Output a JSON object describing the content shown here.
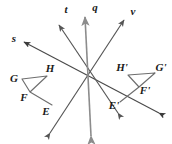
{
  "figure": {
    "background_color": "#ffffff",
    "width": 172,
    "height": 144,
    "center_of_rotation": {
      "x": 88,
      "y": 78
    },
    "colors": {
      "dark_line": "#3b3b3b",
      "gray_line": "#8c8c8c",
      "label_text": "#1a1a1a",
      "shape_stroke": "#6e6e6e"
    },
    "lines": [
      {
        "name": "t",
        "label": "t",
        "label_pos": {
          "x": 66,
          "y": 10
        },
        "color": "#555555",
        "from": {
          "x": 118,
          "y": 113
        },
        "to": {
          "x": 59,
          "y": 25
        },
        "arrow_start": true,
        "arrow_end": true
      },
      {
        "name": "q",
        "label": "q",
        "label_pos": {
          "x": 95,
          "y": 8
        },
        "color": "#8c8c8c",
        "from": {
          "x": 91,
          "y": 136
        },
        "to": {
          "x": 85,
          "y": 17
        },
        "arrow_start": true,
        "arrow_end": true
      },
      {
        "name": "v",
        "label": "v",
        "label_pos": {
          "x": 133,
          "y": 12
        },
        "color": "#555555",
        "from": {
          "x": 50,
          "y": 133
        },
        "to": {
          "x": 124,
          "y": 20
        },
        "arrow_start": true,
        "arrow_end": true
      },
      {
        "name": "s",
        "label": "s",
        "label_pos": {
          "x": 14,
          "y": 39
        },
        "color": "#4a4a4a",
        "from": {
          "x": 159,
          "y": 113
        },
        "to": {
          "x": 24,
          "y": 42
        },
        "arrow_start": true,
        "arrow_end": true
      }
    ],
    "shapes": [
      {
        "name": "preimage-EFGH",
        "stroke": "#6e6e6e",
        "vertices": [
          {
            "label": "E",
            "x": 52,
            "y": 105,
            "label_pos": {
              "x": 46,
              "y": 111
            }
          },
          {
            "label": "F",
            "x": 30,
            "y": 92,
            "label_pos": {
              "x": 24,
              "y": 97
            }
          },
          {
            "label": "G",
            "x": 22,
            "y": 79,
            "label_pos": {
              "x": 15,
              "y": 79
            }
          },
          {
            "label": "H",
            "x": 47,
            "y": 76,
            "label_pos": {
              "x": 49,
              "y": 70
            }
          }
        ]
      },
      {
        "name": "image-EFGH-prime",
        "stroke": "#6e6e6e",
        "vertices": [
          {
            "label": "E'",
            "x": 120,
            "y": 102,
            "label_pos": {
              "x": 116,
              "y": 106
            }
          },
          {
            "label": "F'",
            "x": 139,
            "y": 87,
            "label_pos": {
              "x": 143,
              "y": 90
            }
          },
          {
            "label": "G'",
            "x": 155,
            "y": 73,
            "label_pos": {
              "x": 160,
              "y": 70
            }
          },
          {
            "label": "H'",
            "x": 128,
            "y": 75,
            "label_pos": {
              "x": 123,
              "y": 69
            }
          }
        ]
      }
    ],
    "labels": {
      "line_t": "t",
      "line_q": "q",
      "line_v": "v",
      "line_s": "s",
      "vertex_E": "E",
      "vertex_F": "F",
      "vertex_G": "G",
      "vertex_H": "H",
      "vertex_E_prime": "E'",
      "vertex_F_prime": "F'",
      "vertex_G_prime": "G'",
      "vertex_H_prime": "H'"
    }
  }
}
